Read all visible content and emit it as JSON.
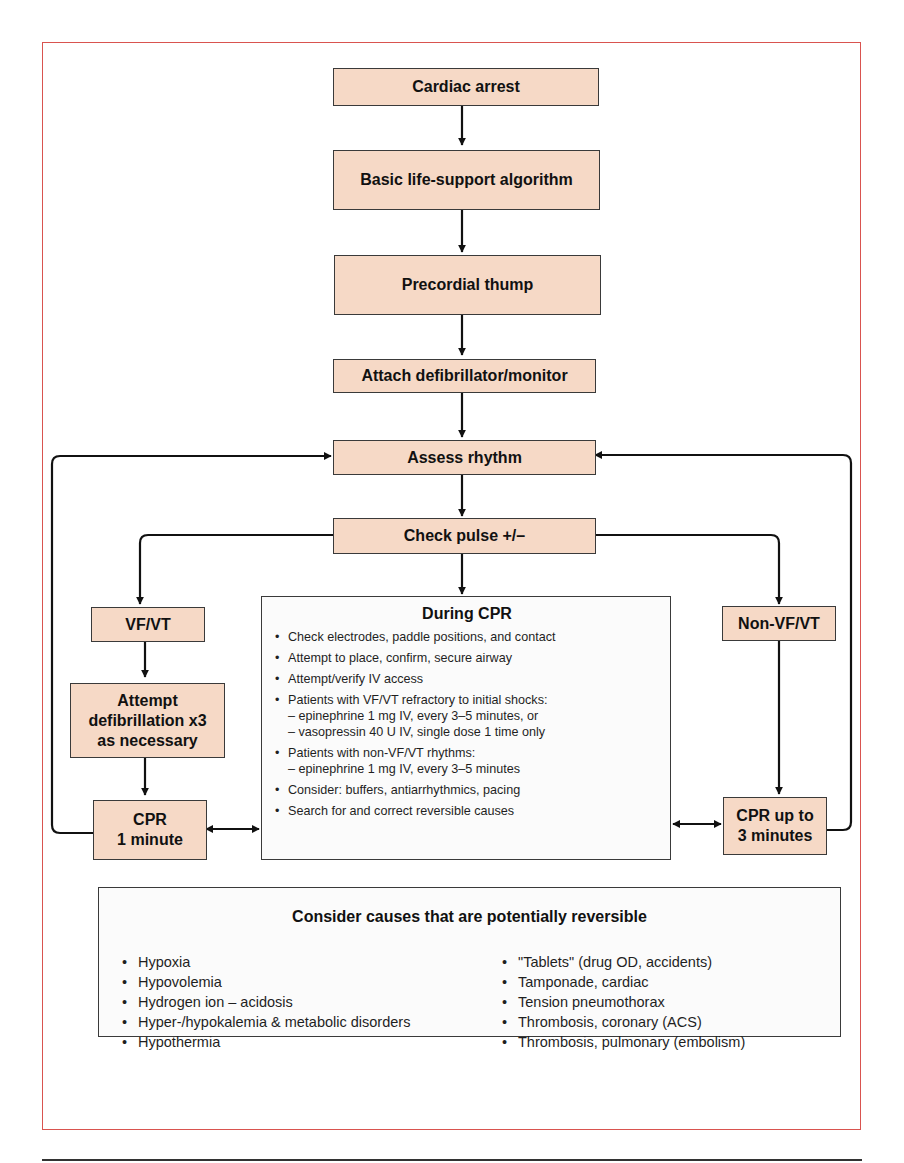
{
  "diagram": {
    "type": "flowchart",
    "nodes": {
      "cardiac_arrest": "Cardiac arrest",
      "basic_life_support": "Basic life-support algorithm",
      "precordial_thump": "Precordial thump",
      "attach_defibrillator": "Attach defibrillator/monitor",
      "assess_rhythm": "Assess rhythm",
      "check_pulse": "Check pulse +/–",
      "vf_vt": "VF/VT",
      "attempt_defib_line1": "Attempt",
      "attempt_defib_line2": "defibrillation x3",
      "attempt_defib_line3": "as necessary",
      "cpr_1min_line1": "CPR",
      "cpr_1min_line2": "1 minute",
      "non_vf_vt": "Non-VF/VT",
      "cpr_3min_line1": "CPR up to",
      "cpr_3min_line2": "3 minutes"
    },
    "during_cpr": {
      "title": "During CPR",
      "items": [
        {
          "text": "Check electrodes, paddle positions, and contact"
        },
        {
          "text": "Attempt to place, confirm, secure airway"
        },
        {
          "text": "Attempt/verify IV access"
        },
        {
          "text": "Patients with VF/VT refractory to initial shocks:",
          "sub1": "– epinephrine 1 mg IV, every 3–5 minutes, or",
          "sub2": "– vasopressin 40 U IV, single dose 1 time only"
        },
        {
          "text": "Patients with non-VF/VT rhythms:",
          "sub1": "– epinephrine 1 mg IV, every 3–5 minutes"
        },
        {
          "text": "Consider: buffers, antiarrhythmics, pacing"
        },
        {
          "text": "Search for and correct reversible causes"
        }
      ]
    },
    "reversible_causes": {
      "title": "Consider causes that are potentially reversible",
      "left": [
        "Hypoxia",
        "Hypovolemia",
        "Hydrogen ion – acidosis",
        "Hyper-/hypokalemia & metabolic disorders",
        "Hypothermia"
      ],
      "right": [
        "\"Tablets\" (drug OD, accidents)",
        "Tamponade, cardiac",
        "Tension pneumothorax",
        "Thrombosis, coronary (ACS)",
        "Thrombosis, pulmonary (embolism)"
      ]
    },
    "colors": {
      "node_fill": "#f6d9c6",
      "frame_border": "#d9534f",
      "line": "#111111"
    }
  }
}
